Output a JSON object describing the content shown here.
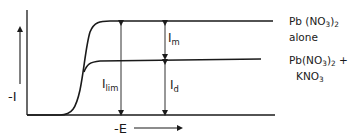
{
  "diagram": {
    "type": "polarogram",
    "y_axis_label": "-I",
    "x_axis_label": "-E",
    "curves": [
      {
        "id": "pb-alone",
        "label_line1_main": "Pb (NO",
        "label_line1_sub": "3",
        "label_line1_close": ")",
        "label_line1_sub2": "2",
        "label_line2": "alone"
      },
      {
        "id": "pb-kno3",
        "label_line1_main": "Pb(NO",
        "label_line1_sub": "3",
        "label_line1_close": ")",
        "label_line1_sub2": "2",
        "label_line1_suffix": " +",
        "label_line2_main": "KNO",
        "label_line2_sub": "3"
      }
    ],
    "annotations": {
      "ilim": {
        "main": "I",
        "sub": "lim"
      },
      "im": {
        "main": "I",
        "sub": "m"
      },
      "id": {
        "main": "I",
        "sub": "d"
      }
    },
    "colors": {
      "line": "#1a1a1a",
      "background": "#ffffff"
    }
  }
}
